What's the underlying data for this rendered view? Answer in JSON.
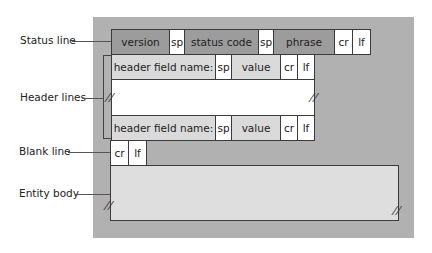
{
  "labels": {
    "status_line": "Status line",
    "header_lines": "Header lines",
    "blank_line": "Blank line",
    "entity_body": "Entity body"
  },
  "status_row": [
    "version",
    "sp",
    "status code",
    "sp",
    "phrase",
    "cr",
    "lf"
  ],
  "header_row_1": [
    "header field name:",
    "sp",
    "value",
    "cr",
    "lf"
  ],
  "header_row_2": [
    "header field name:",
    "sp",
    "value",
    "cr",
    "lf"
  ],
  "blank_row": [
    "cr",
    "lf"
  ],
  "break_symbol": "//",
  "colors": {
    "background_panel": "#b1b1b1",
    "status_fields": "#9c9c9c",
    "header_fields": "#dadada",
    "delimiters": "#ffffff",
    "entity_body": "#dedede"
  }
}
